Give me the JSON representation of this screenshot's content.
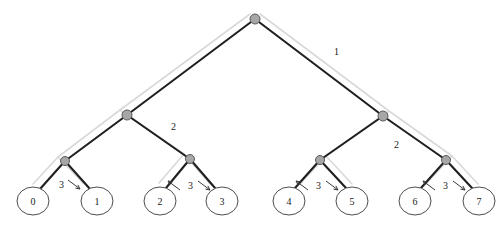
{
  "diagram": {
    "background": "#ffffff",
    "edge_color": "#1f1f1f",
    "shadow_color": "#d9d9d9",
    "node_fill": "#a6a6a6",
    "node_stroke": "#5a5a5a",
    "leaf_stroke": "#4d4d4d",
    "leaf_fill": "#ffffff",
    "text_color": "#1a1a1a"
  },
  "nodes": {
    "root": {
      "id": "root",
      "cx": 255,
      "cy": 19,
      "r": 5
    },
    "internal": [
      {
        "id": "n-l1",
        "cx": 127,
        "cy": 115,
        "r": 5
      },
      {
        "id": "n-r1",
        "cx": 383,
        "cy": 116,
        "r": 5
      },
      {
        "id": "n-l2a",
        "cx": 65,
        "cy": 161,
        "r": 4.5
      },
      {
        "id": "n-l2b",
        "cx": 190,
        "cy": 159,
        "r": 4.5
      },
      {
        "id": "n-r2a",
        "cx": 320,
        "cy": 160,
        "r": 4.5
      },
      {
        "id": "n-r2b",
        "cx": 446,
        "cy": 160,
        "r": 4.5
      }
    ]
  },
  "leaves": [
    {
      "id": "leaf-0",
      "label": "0",
      "cx": 33,
      "cy": 201,
      "rx": 16,
      "ry": 14
    },
    {
      "id": "leaf-1",
      "label": "1",
      "cx": 97,
      "cy": 201,
      "rx": 16,
      "ry": 14
    },
    {
      "id": "leaf-2",
      "label": "2",
      "cx": 160,
      "cy": 201,
      "rx": 16,
      "ry": 14
    },
    {
      "id": "leaf-3",
      "label": "3",
      "cx": 222,
      "cy": 201,
      "rx": 16,
      "ry": 14
    },
    {
      "id": "leaf-4",
      "label": "4",
      "cx": 289,
      "cy": 201,
      "rx": 16,
      "ry": 14
    },
    {
      "id": "leaf-5",
      "label": "5",
      "cx": 352,
      "cy": 201,
      "rx": 16,
      "ry": 14
    },
    {
      "id": "leaf-6",
      "label": "6",
      "cx": 415,
      "cy": 201,
      "rx": 16,
      "ry": 14
    },
    {
      "id": "leaf-7",
      "label": "7",
      "cx": 479,
      "cy": 201,
      "rx": 16,
      "ry": 14
    }
  ],
  "edges": [
    {
      "id": "e-root-l1",
      "x1": 255,
      "y1": 19,
      "x2": 127,
      "y2": 115
    },
    {
      "id": "e-root-r1",
      "x1": 255,
      "y1": 19,
      "x2": 383,
      "y2": 116
    },
    {
      "id": "e-l1-l2a",
      "x1": 127,
      "y1": 115,
      "x2": 65,
      "y2": 161
    },
    {
      "id": "e-l1-l2b",
      "x1": 127,
      "y1": 115,
      "x2": 190,
      "y2": 159
    },
    {
      "id": "e-r1-r2a",
      "x1": 383,
      "y1": 116,
      "x2": 320,
      "y2": 160
    },
    {
      "id": "e-r1-r2b",
      "x1": 383,
      "y1": 116,
      "x2": 446,
      "y2": 160
    },
    {
      "id": "e-l2a-0",
      "x1": 65,
      "y1": 161,
      "x2": 40,
      "y2": 189
    },
    {
      "id": "e-l2a-1",
      "x1": 65,
      "y1": 161,
      "x2": 90,
      "y2": 189
    },
    {
      "id": "e-l2b-2",
      "x1": 190,
      "y1": 159,
      "x2": 166,
      "y2": 188
    },
    {
      "id": "e-l2b-3",
      "x1": 190,
      "y1": 159,
      "x2": 215,
      "y2": 188
    },
    {
      "id": "e-r2a-4",
      "x1": 320,
      "y1": 160,
      "x2": 295,
      "y2": 188
    },
    {
      "id": "e-r2a-5",
      "x1": 320,
      "y1": 160,
      "x2": 346,
      "y2": 188
    },
    {
      "id": "e-r2b-6",
      "x1": 446,
      "y1": 160,
      "x2": 421,
      "y2": 188
    },
    {
      "id": "e-r2b-7",
      "x1": 446,
      "y1": 160,
      "x2": 472,
      "y2": 188
    }
  ],
  "edge_labels": [
    {
      "id": "lbl-level-1",
      "text": "1",
      "x": 334,
      "y": 47
    },
    {
      "id": "lbl-level-2a",
      "text": "2",
      "x": 171,
      "y": 122
    },
    {
      "id": "lbl-level-2b",
      "text": "2",
      "x": 394,
      "y": 140
    },
    {
      "id": "lbl-level-3a",
      "text": "3",
      "x": 59,
      "y": 180
    },
    {
      "id": "lbl-level-3b",
      "text": "3",
      "x": 188,
      "y": 181
    },
    {
      "id": "lbl-level-3c",
      "text": "3",
      "x": 316,
      "y": 181
    },
    {
      "id": "lbl-level-3d",
      "text": "3",
      "x": 443,
      "y": 181
    }
  ],
  "arrows": [
    {
      "id": "arrow-3a-right",
      "x1": 68,
      "y1": 180,
      "x2": 80,
      "y2": 189
    },
    {
      "id": "arrow-3b-left",
      "x1": 180,
      "y1": 190,
      "x2": 168,
      "y2": 181
    },
    {
      "id": "arrow-3b-right",
      "x1": 198,
      "y1": 181,
      "x2": 210,
      "y2": 190
    },
    {
      "id": "arrow-3c-left",
      "x1": 308,
      "y1": 190,
      "x2": 296,
      "y2": 181
    },
    {
      "id": "arrow-3c-right",
      "x1": 326,
      "y1": 181,
      "x2": 338,
      "y2": 190
    },
    {
      "id": "arrow-3d-left",
      "x1": 435,
      "y1": 190,
      "x2": 423,
      "y2": 181
    },
    {
      "id": "arrow-3d-right",
      "x1": 453,
      "y1": 181,
      "x2": 465,
      "y2": 190
    }
  ],
  "shadow_paths": [
    {
      "id": "shadow-top-left",
      "d": "M 250 14 L 120 110 L 58 157 L 33 184"
    },
    {
      "id": "shadow-left-inner",
      "d": "M 120 110 L 184 154 L 159 183"
    },
    {
      "id": "shadow-left-outer2",
      "d": "M 58 157 L 84 184"
    },
    {
      "id": "shadow-left-mid",
      "d": "M 184 154 L 210 184"
    },
    {
      "id": "shadow-top-right",
      "d": "M 260 14 L 389 111 L 452 156 L 478 184"
    },
    {
      "id": "shadow-right-inner",
      "d": "M 389 111 L 326 156 L 300 184"
    },
    {
      "id": "shadow-right-mid",
      "d": "M 326 156 L 352 184"
    },
    {
      "id": "shadow-right-out2",
      "d": "M 452 156 L 426 184"
    }
  ]
}
